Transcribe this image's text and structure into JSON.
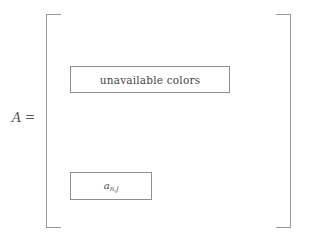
{
  "figure": {
    "type": "matrix-diagram",
    "background_color": "#ffffff",
    "line_color": "#9a9a9a",
    "box_border_color": "#8f8f8f",
    "text_color": "#444444"
  },
  "label": {
    "variable": "A",
    "equals": "="
  },
  "matrix": {
    "left_bracket": "[",
    "right_bracket": "]",
    "cells": [
      {
        "id": "unavailable-colors",
        "text": "unavailable colors",
        "style": "upright"
      },
      {
        "id": "entry-anj",
        "base": "a",
        "subscript": "n,j",
        "style": "italic-math"
      }
    ]
  }
}
